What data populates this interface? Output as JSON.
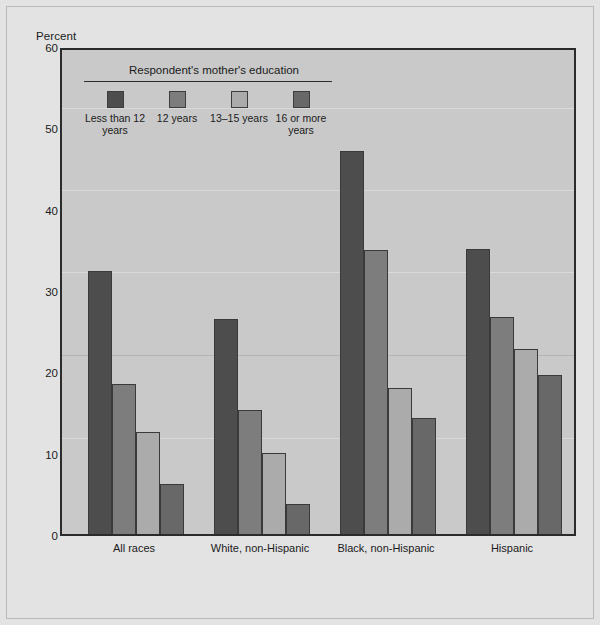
{
  "chart_data": {
    "type": "bar",
    "title": "",
    "ylabel": "Percent",
    "xlabel": "",
    "ylim": [
      0,
      60
    ],
    "yticks": [
      0,
      10,
      20,
      30,
      40,
      50,
      60
    ],
    "grid": false,
    "legend_position": "inside-top-left",
    "legend_title": "Respondent's mother's education",
    "categories": [
      "All races",
      "White, non-Hispanic",
      "Black, non-Hispanic",
      "Hispanic"
    ],
    "series": [
      {
        "name": "Less than 12 years",
        "color": "#4d4d4d",
        "values": [
          32.3,
          26.4,
          47.1,
          35.1
        ]
      },
      {
        "name": "12 years",
        "color": "#7d7d7d",
        "values": [
          18.4,
          15.2,
          34.9,
          26.7
        ]
      },
      {
        "name": "13–15 years",
        "color": "#ababab",
        "values": [
          12.6,
          9.9,
          17.9,
          22.7
        ]
      },
      {
        "name": "16 or more years",
        "color": "#686868",
        "values": [
          6.2,
          3.7,
          14.3,
          19.6
        ]
      }
    ]
  }
}
